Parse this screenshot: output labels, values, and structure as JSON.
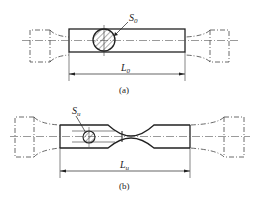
{
  "diagram": {
    "figure_a": {
      "caption": "(a)",
      "area_label": "S",
      "area_sub": "0",
      "length_label": "L",
      "length_sub": "0"
    },
    "figure_b": {
      "caption": "(b)",
      "area_label": "S",
      "area_sub": "u",
      "length_label": "L",
      "length_sub": "u"
    },
    "colors": {
      "line": "#222222",
      "background": "#ffffff"
    }
  }
}
